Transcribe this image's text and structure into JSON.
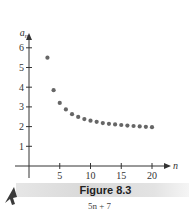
{
  "chart_data": {
    "type": "scatter",
    "title": "",
    "xlabel": "n",
    "ylabel": "a_n",
    "ylabel_base": "a",
    "ylabel_sub": "n",
    "xlim": [
      0,
      22
    ],
    "ylim": [
      0,
      6.8
    ],
    "x_ticks": [
      5,
      10,
      15,
      20
    ],
    "x_tick_labels": [
      "5",
      "10",
      "15",
      "20"
    ],
    "y_ticks": [
      1,
      2,
      3,
      4,
      5,
      6
    ],
    "y_tick_labels": [
      "1",
      "2",
      "3",
      "4",
      "5",
      "6"
    ],
    "grid": false,
    "legend": "none",
    "x": [
      3,
      4,
      5,
      6,
      7,
      8,
      9,
      10,
      11,
      12,
      13,
      14,
      15,
      16,
      17,
      18,
      19,
      20
    ],
    "y": [
      5.5,
      3.85,
      3.2,
      2.87,
      2.63,
      2.49,
      2.38,
      2.3,
      2.24,
      2.18,
      2.14,
      2.11,
      2.08,
      2.05,
      2.03,
      2.01,
      1.99,
      1.97
    ]
  },
  "caption": {
    "figure_label": "Figure 8.3",
    "partial_text_below": "5n + 7"
  },
  "colors": {
    "point": "#666666",
    "axis": "#333333"
  }
}
